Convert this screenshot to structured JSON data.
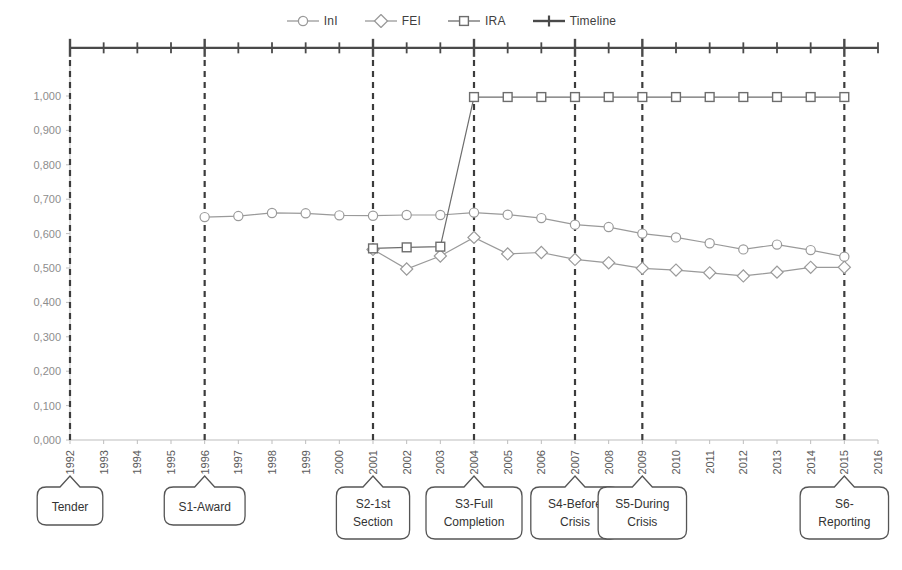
{
  "legend": {
    "position": "top-center",
    "items": [
      {
        "label": "InI",
        "marker": "circle-marker-icon",
        "color": "#9a9a9a"
      },
      {
        "label": "FEI",
        "marker": "diamond-marker-icon",
        "color": "#9a9a9a"
      },
      {
        "label": "IRA",
        "marker": "square-marker-icon",
        "color": "#6d6d6d"
      },
      {
        "label": "Timeline",
        "marker": "plus-marker-icon",
        "color": "#4a4a4a"
      }
    ]
  },
  "chart_data": {
    "type": "line",
    "title": "",
    "xlabel": "",
    "ylabel": "",
    "ylim": [
      0.0,
      1.0
    ],
    "xlim": [
      1992,
      2016
    ],
    "grid": false,
    "legend_position": "top-center",
    "decimal_separator": ",",
    "x": [
      1992,
      1993,
      1994,
      1995,
      1996,
      1997,
      1998,
      1999,
      2000,
      2001,
      2002,
      2003,
      2004,
      2005,
      2006,
      2007,
      2008,
      2009,
      2010,
      2011,
      2012,
      2013,
      2014,
      2015,
      2016
    ],
    "ytick_labels": [
      "0,000",
      "0,100",
      "0,200",
      "0,300",
      "0,400",
      "0,500",
      "0,600",
      "0,700",
      "0,800",
      "0,900",
      "1,000"
    ],
    "ytick_values": [
      0.0,
      0.1,
      0.2,
      0.3,
      0.4,
      0.5,
      0.6,
      0.7,
      0.8,
      0.9,
      1.0
    ],
    "xtick_labels": [
      "1992",
      "1993",
      "1994",
      "1995",
      "1996",
      "1997",
      "1998",
      "1999",
      "2000",
      "2001",
      "2002",
      "2003",
      "2004",
      "2005",
      "2006",
      "2007",
      "2008",
      "2009",
      "2010",
      "2011",
      "2012",
      "2013",
      "2014",
      "2015",
      "2016"
    ],
    "series": [
      {
        "name": "InI",
        "marker": "circle",
        "color": "#9a9a9a",
        "points": [
          {
            "x": 1996,
            "y": 0.648
          },
          {
            "x": 1997,
            "y": 0.651
          },
          {
            "x": 1998,
            "y": 0.66
          },
          {
            "x": 1999,
            "y": 0.659
          },
          {
            "x": 2000,
            "y": 0.653
          },
          {
            "x": 2001,
            "y": 0.652
          },
          {
            "x": 2002,
            "y": 0.654
          },
          {
            "x": 2003,
            "y": 0.654
          },
          {
            "x": 2004,
            "y": 0.661
          },
          {
            "x": 2005,
            "y": 0.655
          },
          {
            "x": 2006,
            "y": 0.645
          },
          {
            "x": 2007,
            "y": 0.626
          },
          {
            "x": 2008,
            "y": 0.619
          },
          {
            "x": 2009,
            "y": 0.6
          },
          {
            "x": 2010,
            "y": 0.589
          },
          {
            "x": 2011,
            "y": 0.572
          },
          {
            "x": 2012,
            "y": 0.554
          },
          {
            "x": 2013,
            "y": 0.568
          },
          {
            "x": 2014,
            "y": 0.552
          },
          {
            "x": 2015,
            "y": 0.533
          }
        ]
      },
      {
        "name": "FEI",
        "marker": "diamond",
        "color": "#9a9a9a",
        "points": [
          {
            "x": 2001,
            "y": 0.554
          },
          {
            "x": 2002,
            "y": 0.497
          },
          {
            "x": 2003,
            "y": 0.535
          },
          {
            "x": 2004,
            "y": 0.589
          },
          {
            "x": 2005,
            "y": 0.541
          },
          {
            "x": 2006,
            "y": 0.545
          },
          {
            "x": 2007,
            "y": 0.525
          },
          {
            "x": 2008,
            "y": 0.515
          },
          {
            "x": 2009,
            "y": 0.499
          },
          {
            "x": 2010,
            "y": 0.494
          },
          {
            "x": 2011,
            "y": 0.486
          },
          {
            "x": 2012,
            "y": 0.477
          },
          {
            "x": 2013,
            "y": 0.488
          },
          {
            "x": 2014,
            "y": 0.502
          },
          {
            "x": 2015,
            "y": 0.502
          }
        ]
      },
      {
        "name": "IRA",
        "marker": "square",
        "color": "#6d6d6d",
        "points": [
          {
            "x": 2001,
            "y": 0.557
          },
          {
            "x": 2002,
            "y": 0.56
          },
          {
            "x": 2003,
            "y": 0.562
          },
          {
            "x": 2004,
            "y": 0.997
          },
          {
            "x": 2005,
            "y": 0.997
          },
          {
            "x": 2006,
            "y": 0.997
          },
          {
            "x": 2007,
            "y": 0.997
          },
          {
            "x": 2008,
            "y": 0.997
          },
          {
            "x": 2009,
            "y": 0.997
          },
          {
            "x": 2010,
            "y": 0.997
          },
          {
            "x": 2011,
            "y": 0.997
          },
          {
            "x": 2012,
            "y": 0.997
          },
          {
            "x": 2013,
            "y": 0.997
          },
          {
            "x": 2014,
            "y": 0.997
          },
          {
            "x": 2015,
            "y": 0.997
          }
        ]
      },
      {
        "name": "Timeline",
        "marker": "plus",
        "color": "#4a4a4a",
        "points": [
          {
            "x": 1992,
            "y": 1.14
          },
          {
            "x": 1993,
            "y": 1.14
          },
          {
            "x": 1994,
            "y": 1.14
          },
          {
            "x": 1995,
            "y": 1.14
          },
          {
            "x": 1996,
            "y": 1.14
          },
          {
            "x": 1997,
            "y": 1.14
          },
          {
            "x": 1998,
            "y": 1.14
          },
          {
            "x": 1999,
            "y": 1.14
          },
          {
            "x": 2000,
            "y": 1.14
          },
          {
            "x": 2001,
            "y": 1.14
          },
          {
            "x": 2002,
            "y": 1.14
          },
          {
            "x": 2003,
            "y": 1.14
          },
          {
            "x": 2004,
            "y": 1.14
          },
          {
            "x": 2005,
            "y": 1.14
          },
          {
            "x": 2006,
            "y": 1.14
          },
          {
            "x": 2007,
            "y": 1.14
          },
          {
            "x": 2008,
            "y": 1.14
          },
          {
            "x": 2009,
            "y": 1.14
          },
          {
            "x": 2010,
            "y": 1.14
          },
          {
            "x": 2011,
            "y": 1.14
          },
          {
            "x": 2012,
            "y": 1.14
          },
          {
            "x": 2013,
            "y": 1.14
          },
          {
            "x": 2014,
            "y": 1.14
          },
          {
            "x": 2015,
            "y": 1.14
          },
          {
            "x": 2016,
            "y": 1.14
          }
        ]
      }
    ],
    "milestones": [
      {
        "year": 1992,
        "label": "Tender",
        "lines": [
          "Tender"
        ]
      },
      {
        "year": 1996,
        "label": "S1-Award",
        "lines": [
          "S1-Award"
        ]
      },
      {
        "year": 2001,
        "label": "S2-1st Section",
        "lines": [
          "S2-1st",
          "Section"
        ]
      },
      {
        "year": 2004,
        "label": "S3-Full Completion",
        "lines": [
          "S3-Full",
          "Completion"
        ]
      },
      {
        "year": 2007,
        "label": "S4-Before Crisis",
        "lines": [
          "S4-Before",
          "Crisis"
        ]
      },
      {
        "year": 2009,
        "label": "S5-During Crisis",
        "lines": [
          "S5-During",
          "Crisis"
        ]
      },
      {
        "year": 2015,
        "label": "S6-Reporting",
        "lines": [
          "S6-",
          "Reporting"
        ]
      }
    ]
  },
  "colors": {
    "background": "#ffffff",
    "axis": "#bdbdbd",
    "milestone_line": "#3c3c3c",
    "ini": "#9a9a9a",
    "fei": "#9a9a9a",
    "ira": "#6d6d6d",
    "timeline": "#4a4a4a",
    "callout_border": "#555555",
    "callout_text": "#333333"
  }
}
